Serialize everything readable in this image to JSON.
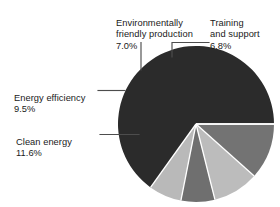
{
  "chart_data": {
    "type": "pie",
    "title": "",
    "subtitle": "",
    "xlabel": "",
    "ylabel": "",
    "legend_position": "none",
    "grid": false,
    "labels_shown": "callout labels with leader lines",
    "categories": [
      "Training and support",
      "Environmentally friendly production",
      "Energy efficiency",
      "Clean energy",
      "Other"
    ],
    "values": [
      6.8,
      7.0,
      9.5,
      11.6,
      65.1
    ],
    "units": "%",
    "start_angle_deg": 0,
    "direction": "counterclockwise",
    "slices": [
      {
        "name": "Training and support",
        "value": 6.8,
        "value_label": "6.8%",
        "color": "#b9b9b9",
        "labelled": true
      },
      {
        "name": "Environmentally friendly production",
        "value": 7.0,
        "value_label": "7.0%",
        "color": "#6f6f6f",
        "labelled": true
      },
      {
        "name": "Energy efficiency",
        "value": 9.5,
        "value_label": "9.5%",
        "color": "#bcbcbc",
        "labelled": true
      },
      {
        "name": "Clean energy",
        "value": 11.6,
        "value_label": "11.6%",
        "color": "#737373",
        "labelled": true
      },
      {
        "name": "Other",
        "value": 65.1,
        "value_label": "",
        "color": "#2b2b2b",
        "labelled": false
      }
    ]
  },
  "callouts": {
    "environmentally_friendly": {
      "name": "Environmentally\nfriendly production",
      "percent": "7.0%"
    },
    "training_and_support": {
      "name": "Training\nand support",
      "percent": "6.8%"
    },
    "energy_efficiency": {
      "name": "Energy efficiency",
      "percent": "9.5%"
    },
    "clean_energy": {
      "name": "Clean energy",
      "percent": "11.6%"
    }
  },
  "colors": {
    "background": "#ffffff",
    "text": "#1a1a1a",
    "leader_line": "#4d4d4d",
    "slice_separator": "#ffffff"
  }
}
